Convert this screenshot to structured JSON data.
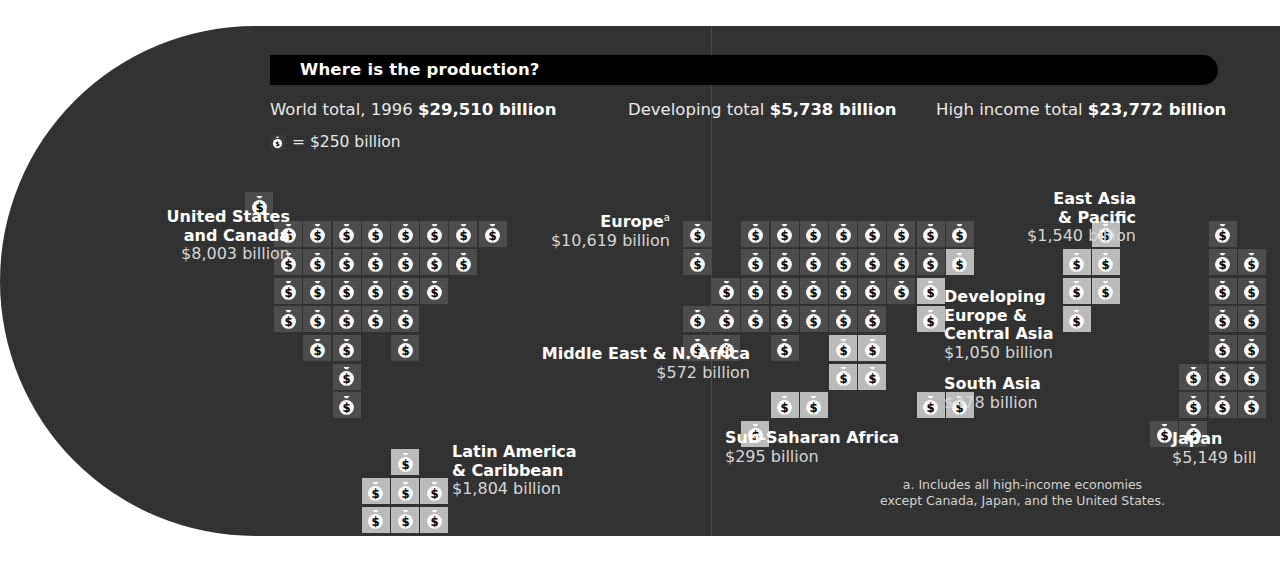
{
  "title": "Where is the production?",
  "totals": [
    {
      "id": "world",
      "label": "World total, 1996 ",
      "value": "$29,510 billion"
    },
    {
      "id": "developing",
      "label": "Developing total ",
      "value": "$5,738 billion"
    },
    {
      "id": "high",
      "label": "High income total ",
      "value": "$23,772 billion"
    }
  ],
  "legend": {
    "icon": "money-bag-icon",
    "text": "= $250 billion"
  },
  "footnote": "a. Includes all high-income economies\nexcept Canada, Japan, and the United States.",
  "footnote_line1": "a. Includes all high-income economies",
  "footnote_line2": "except Canada, Japan, and the United States.",
  "colors": {
    "panel": "#2e2e2e",
    "titlebar": "#000000",
    "tile_high_income": "#4a4a4a",
    "tile_developing": "#bdbdbd",
    "text": "#ffffff",
    "value_text": "#d6d6d6"
  },
  "regions": [
    {
      "id": "us-canada",
      "name": "United States\nand Canada",
      "name_l1": "United States",
      "name_l2": "and Canada",
      "value": "$8,003 billion",
      "align": "right"
    },
    {
      "id": "europe",
      "name": "Europe",
      "superscript": "a",
      "value": "$10,619 billion",
      "align": "right"
    },
    {
      "id": "east-asia-pacific",
      "name": "East Asia\n& Pacific",
      "name_l1": "East Asia",
      "name_l2": "& Pacific",
      "value": "$1,540 billion",
      "align": "right"
    },
    {
      "id": "developing-europe-central-asia",
      "name": "Developing\nEurope &\nCentral Asia",
      "name_l1": "Developing",
      "name_l2": "Europe &",
      "name_l3": "Central Asia",
      "value": "$1,050 billion",
      "align": "left"
    },
    {
      "id": "middle-east-n-africa",
      "name": "Middle East & N. Africa",
      "value": "$572 billion",
      "align": "right"
    },
    {
      "id": "south-asia",
      "name": "South Asia",
      "value": "$478 billion",
      "align": "left"
    },
    {
      "id": "sub-saharan-africa",
      "name": "Sub-Saharan Africa",
      "value": "$295 billion",
      "align": "left"
    },
    {
      "id": "latin-america-caribbean",
      "name": "Latin America\n& Caribbean",
      "name_l1": "Latin America",
      "name_l2": "& Caribbean",
      "value": "$1,804 billion",
      "align": "left"
    },
    {
      "id": "japan",
      "name": "Japan",
      "value": "$5,149 bill",
      "align": "left"
    }
  ],
  "chart_data": {
    "type": "pictogram",
    "title": "Where is the production?",
    "unit_value": 250,
    "unit_label": "$250 billion",
    "currency": "USD",
    "year": 1996,
    "units": "billion",
    "world_total": 29510,
    "developing_total": 5738,
    "high_income_total": 23772,
    "categories": [
      "United States and Canada",
      "Europe",
      "Japan",
      "East Asia & Pacific",
      "Latin America & Caribbean",
      "Developing Europe & Central Asia",
      "Middle East & N. Africa",
      "South Asia",
      "Sub-Saharan Africa"
    ],
    "values": [
      8003,
      10619,
      5149,
      1540,
      1804,
      1050,
      572,
      478,
      295
    ],
    "icon_counts": [
      32,
      42,
      21,
      6,
      7,
      4,
      2,
      2,
      1
    ],
    "series": [
      {
        "name": "High income",
        "values": [
          8003,
          10619,
          5149,
          null,
          null,
          null,
          null,
          null,
          null
        ]
      },
      {
        "name": "Developing",
        "values": [
          null,
          null,
          null,
          1540,
          1804,
          1050,
          572,
          478,
          295
        ]
      }
    ],
    "legend": [
      "High income (dark tile)",
      "Developing (light tile)"
    ],
    "xlabel": "",
    "ylabel": "Gross domestic product ($ billion)",
    "grid": false
  }
}
